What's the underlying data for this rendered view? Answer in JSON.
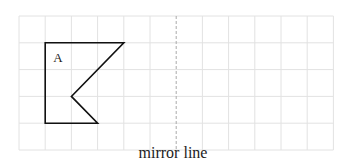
{
  "diagram": {
    "grid": {
      "columns": 12,
      "rows": 5,
      "line_color": "#e2e2e2"
    },
    "shape": {
      "label": "A",
      "stroke_color": "#111111",
      "vertices_grid": [
        [
          1,
          1
        ],
        [
          4,
          1
        ],
        [
          2,
          3
        ],
        [
          3,
          4
        ],
        [
          1,
          4
        ]
      ]
    },
    "mirror_line": {
      "column": 6,
      "style": "dashed",
      "color": "#aaaaaa"
    },
    "caption": "mirror line"
  }
}
